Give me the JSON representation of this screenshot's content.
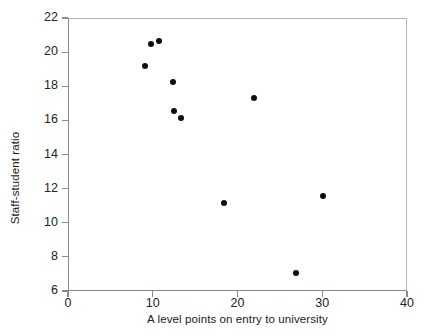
{
  "chart_data": {
    "type": "scatter",
    "title": "",
    "xlabel": "A level points on entry to university",
    "ylabel": "Staff-student ratio",
    "xlim": [
      0,
      40
    ],
    "ylim": [
      6,
      22
    ],
    "xticks": [
      0,
      10,
      20,
      30,
      40
    ],
    "yticks": [
      6,
      8,
      10,
      12,
      14,
      16,
      18,
      20,
      22
    ],
    "xtick_labels": [
      "0",
      "10",
      "20",
      "30",
      "40"
    ],
    "ytick_labels": [
      "6",
      "8",
      "10",
      "12",
      "14",
      "16",
      "18",
      "20",
      "22"
    ],
    "grid": false,
    "legend": null,
    "marker": "filled-circle",
    "marker_color": "#0d0d0d",
    "points": [
      {
        "x": 9.1,
        "y": 19.2
      },
      {
        "x": 9.8,
        "y": 20.5
      },
      {
        "x": 10.7,
        "y": 20.65
      },
      {
        "x": 12.4,
        "y": 18.25
      },
      {
        "x": 12.5,
        "y": 16.55
      },
      {
        "x": 13.3,
        "y": 16.15
      },
      {
        "x": 18.4,
        "y": 11.15
      },
      {
        "x": 21.9,
        "y": 17.3
      },
      {
        "x": 26.9,
        "y": 7.05
      },
      {
        "x": 30.1,
        "y": 11.55
      }
    ]
  },
  "axis_style": {
    "axis_color": "#8a8a8a",
    "frame_color": "#b4b4b4",
    "text_color": "#232323",
    "background": "#ffffff"
  }
}
